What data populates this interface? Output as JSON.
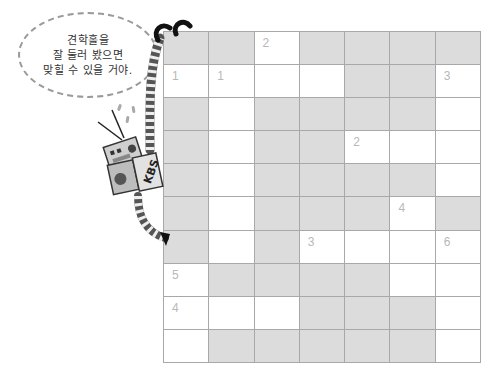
{
  "speech_bubble": {
    "lines": [
      "견학홀을",
      "잘 둘러 봤으면",
      "맞힐 수 있을 거야."
    ]
  },
  "character": {
    "name": "robot",
    "label": "KBS"
  },
  "crossword": {
    "rows": 10,
    "cols": 7,
    "colors": {
      "shaded": "#dcdcdc",
      "open": "#ffffff",
      "line": "#a8a8a8",
      "number": "#b8b8b8"
    },
    "legend": "G = shaded block, W = open cell",
    "grid": [
      [
        "G",
        "G",
        "W",
        "G",
        "G",
        "G",
        "G"
      ],
      [
        "W",
        "W",
        "W",
        "W",
        "G",
        "G",
        "W"
      ],
      [
        "G",
        "W",
        "G",
        "G",
        "G",
        "G",
        "W"
      ],
      [
        "G",
        "W",
        "G",
        "G",
        "W",
        "W",
        "W"
      ],
      [
        "G",
        "W",
        "G",
        "G",
        "G",
        "G",
        "W"
      ],
      [
        "G",
        "W",
        "G",
        "G",
        "G",
        "W",
        "G"
      ],
      [
        "G",
        "W",
        "G",
        "W",
        "W",
        "W",
        "W"
      ],
      [
        "W",
        "G",
        "G",
        "G",
        "G",
        "W",
        "W"
      ],
      [
        "W",
        "W",
        "W",
        "G",
        "G",
        "G",
        "W"
      ],
      [
        "W",
        "G",
        "G",
        "G",
        "G",
        "G",
        "W"
      ]
    ],
    "numbers": [
      {
        "row": 0,
        "col": 2,
        "label": "2"
      },
      {
        "row": 1,
        "col": 0,
        "label": "1"
      },
      {
        "row": 1,
        "col": 1,
        "label": "1"
      },
      {
        "row": 1,
        "col": 6,
        "label": "3"
      },
      {
        "row": 3,
        "col": 4,
        "label": "2"
      },
      {
        "row": 5,
        "col": 5,
        "label": "4"
      },
      {
        "row": 6,
        "col": 3,
        "label": "3"
      },
      {
        "row": 6,
        "col": 6,
        "label": "6"
      },
      {
        "row": 7,
        "col": 0,
        "label": "5"
      },
      {
        "row": 8,
        "col": 0,
        "label": "4"
      }
    ]
  }
}
